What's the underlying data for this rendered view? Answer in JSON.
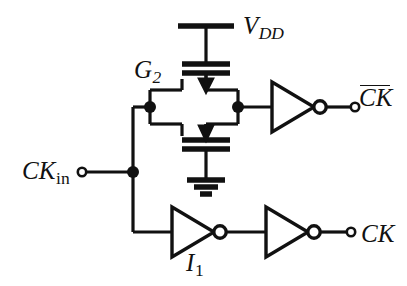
{
  "figure": {
    "kind": "schematic-diagram",
    "background_color": "#ffffff",
    "ink_color": "#111111"
  },
  "labels": {
    "vdd": {
      "base": "V",
      "sub": "DD",
      "sub_style": "italic",
      "overline": false
    },
    "g2": {
      "base": "G",
      "sub": "2",
      "sub_style": "italic",
      "overline": false
    },
    "ck_bar": {
      "base": "CK",
      "sub": "",
      "sub_style": "none",
      "overline": true
    },
    "ck_in": {
      "base": "CK",
      "sub": "in",
      "sub_style": "roman",
      "overline": false
    },
    "i1": {
      "base": "I",
      "sub": "1",
      "sub_style": "roman",
      "overline": false
    },
    "ck": {
      "base": "CK",
      "sub": "",
      "sub_style": "none",
      "overline": false
    }
  },
  "components": {
    "supply_rail": "vdd-rail-bar",
    "ground": "ground-symbol",
    "pmos": "pmos-transistor",
    "nmos": "nmos-transistor",
    "inverter_top": "inverter-triangle",
    "inverter_bottom_first": "inverter-triangle",
    "inverter_bottom_second": "inverter-triangle",
    "input_terminal": "open-terminal-circle",
    "output_terminal_ckbar": "open-terminal-circle",
    "output_terminal_ck": "open-terminal-circle",
    "junction": "junction-dot"
  }
}
